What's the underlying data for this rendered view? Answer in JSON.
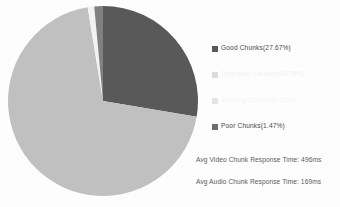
{
  "chart_data": {
    "type": "pie",
    "title": "",
    "subtitle": "",
    "xlabel": "",
    "ylabel": "",
    "grid": false,
    "legend_position": "right",
    "start_angle_deg": 0,
    "direction": "clockwise",
    "categories": [
      "Good Chunks",
      "Degraded Chunks",
      "Warning Chunks",
      "Poor Chunks"
    ],
    "values": [
      27.67,
      69.75,
      1.11,
      1.47
    ],
    "value_unit": "percent",
    "colors": [
      "#595959",
      "#c0c0c0",
      "#f2f2f2",
      "#808080"
    ],
    "slices": [
      {
        "label": "Good Chunks",
        "value": 27.67,
        "legend_text": "Good Chunks(27.67%)",
        "color": "#595959",
        "label_color": "#4a4a4a"
      },
      {
        "label": "Degraded Chunks",
        "value": 69.75,
        "legend_text": "Degraded Chunks(69.75%)",
        "color": "#c0c0c0",
        "label_color": "#f0f0f0"
      },
      {
        "label": "Warning Chunks",
        "value": 1.11,
        "legend_text": "Warning Chunks(1.11%)",
        "color": "#f2f2f2",
        "label_color": "#f2f2f2"
      },
      {
        "label": "Poor Chunks",
        "value": 1.47,
        "legend_text": "Poor Chunks(1.47%)",
        "color": "#808080",
        "label_color": "#4a4a4a"
      }
    ],
    "annotations": [
      "Avg Video Chunk Response Time: 496ms",
      "Avg Audio Chunk Response Time: 169ms"
    ]
  },
  "legend": {
    "items": [
      {
        "text": "Good Chunks(27.67%)",
        "swatch": "#595959",
        "text_color": "#4a4a4a"
      },
      {
        "text": "Degraded Chunks(69.75%)",
        "swatch": "#dcdcdc",
        "text_color": "#f1f1f1"
      },
      {
        "text": "Warning Chunks(1.11%)",
        "swatch": "#e4e4e4",
        "text_color": "#f4f4f4"
      },
      {
        "text": "Poor Chunks(1.47%)",
        "swatch": "#6e6e6e",
        "text_color": "#4a4a4a"
      }
    ]
  },
  "metrics": {
    "video_response_time": "Avg Video Chunk Response Time: 496ms",
    "audio_response_time": "Avg Audio Chunk Response Time: 169ms"
  },
  "watermark": {
    "text": "CHUNK QUALITY"
  }
}
